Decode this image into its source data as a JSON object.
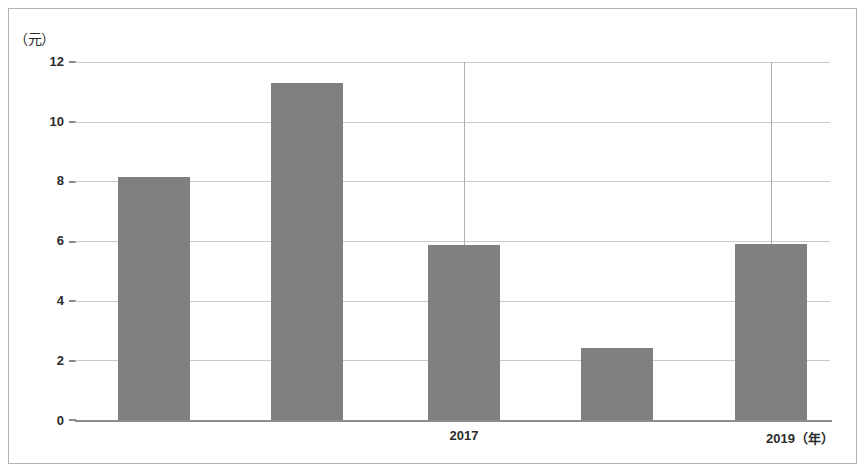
{
  "figure": {
    "border_color": "#b4b4b4",
    "background": "#ffffff"
  },
  "axis": {
    "y_unit_label": "（元）",
    "y_ticks": [
      "0",
      "2",
      "4",
      "6",
      "8",
      "10",
      "12"
    ],
    "x_labels": [
      "2017",
      "2019（年）"
    ],
    "axis_line_color": "#8c8c8c",
    "gridline_color": "#c9c9c9"
  },
  "chart_data": {
    "type": "bar",
    "title": "",
    "subtitle": "",
    "xlabel": "年",
    "ylabel": "元",
    "categories": [
      "2015",
      "2016",
      "2017",
      "2018",
      "2019"
    ],
    "visible_category_labels": [
      "",
      "",
      "2017",
      "",
      "2019（年）"
    ],
    "values": [
      8.15,
      11.3,
      5.85,
      2.4,
      5.9
    ],
    "series": [
      {
        "name": "数值",
        "values": [
          8.15,
          11.3,
          5.85,
          2.4,
          5.9
        ],
        "color": "#808080"
      }
    ],
    "ylim": [
      0,
      12
    ],
    "ytick_step": 2,
    "grid": true,
    "grid_axis": "y",
    "vertical_gridlines_at": [
      "2017",
      "2019"
    ],
    "legend": "none",
    "legend_position": "none",
    "bar_color": "#808080",
    "bar_width_ratio": 0.52,
    "annotations": []
  }
}
